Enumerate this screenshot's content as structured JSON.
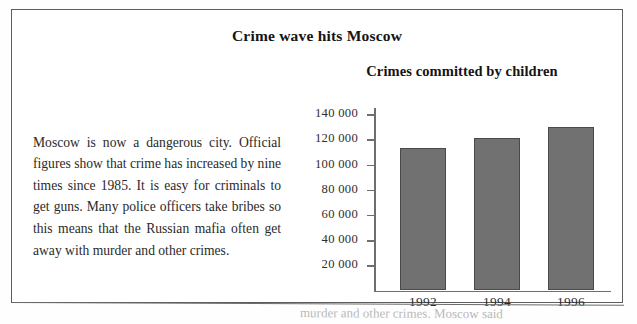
{
  "headline": "Crime wave hits Moscow",
  "article": {
    "text": "Moscow is now a dangerous city. Official figures show that crime has increased by nine times since 1985.  It is easy for criminals to get guns.  Many police officers take bribes so this means that the Russian mafia often get away with murder and other crimes."
  },
  "bleed_text": "murder and other crimes.  Moscow said",
  "colors": {
    "bar_fill": "#717171",
    "bar_border": "#4a4a4a",
    "axis": "#6e6e6e",
    "frame": "#5d5d5d",
    "text": "#1a1a1a"
  },
  "chart_data": {
    "type": "bar",
    "title": "Crimes committed by children",
    "xlabel": "",
    "ylabel": "",
    "categories": [
      "1992",
      "1994",
      "1996"
    ],
    "values": [
      113500,
      121000,
      130000
    ],
    "ylim": [
      0,
      145000
    ],
    "yticks": [
      20000,
      40000,
      60000,
      80000,
      100000,
      120000,
      140000
    ],
    "ytick_labels": [
      "20 000",
      "40 000",
      "60 000",
      "80 000",
      "100 000",
      "120 000",
      "140 000"
    ],
    "grid": false,
    "legend": false
  }
}
